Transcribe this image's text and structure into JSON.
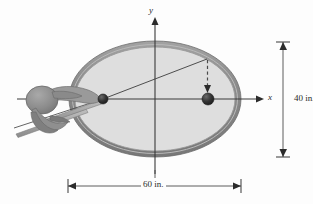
{
  "figure": {
    "axes": {
      "x_label": "x",
      "y_label": "y"
    },
    "dimensions": {
      "major_axis": "60 in.",
      "minor_axis": "40 in."
    },
    "icons": {
      "hand_cue": "hand-holding-cue-icon",
      "ball_left": "focus-ball-left-icon",
      "ball_right": "focus-ball-right-icon",
      "arrow_dashed": "dashed-arrow-icon",
      "x_arrow": "x-axis-arrow-icon",
      "y_arrow": "y-axis-arrow-icon"
    },
    "colors": {
      "table_fill": "#dedede",
      "table_rim": "#8d8d8d",
      "rim_highlight": "#b6b6b6",
      "axis": "#3a3a3a",
      "ball": "#2e2e2e",
      "hand": "#909090",
      "hand_shadow": "#6f6f6f",
      "cue": "#a8a8a8",
      "dimension": "#4a4a4a",
      "background": "#fdfdfd"
    },
    "geometry": {
      "center_x": 155,
      "center_y": 99,
      "semi_major_px": 86,
      "semi_minor_px": 58,
      "focus_left_x": 103,
      "focus_right_x": 208,
      "bounce_point_x": 207,
      "bounce_point_y": 59
    }
  }
}
